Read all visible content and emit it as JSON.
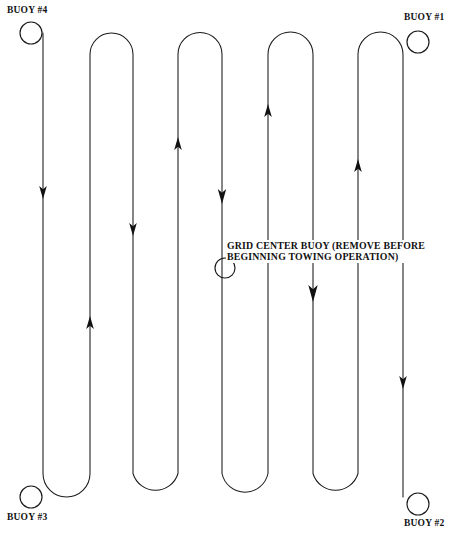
{
  "diagram": {
    "type": "survey-track-plan",
    "stroke_color": "#1a1a1a",
    "background_color": "#ffffff"
  },
  "buoys": [
    {
      "id": "buoy-1",
      "label": "BUOY #1",
      "cx": 418,
      "cy": 42,
      "r": 11
    },
    {
      "id": "buoy-2",
      "label": "BUOY #2",
      "cx": 418,
      "cy": 504,
      "r": 11
    },
    {
      "id": "buoy-3",
      "label": "BUOY #3",
      "cx": 31,
      "cy": 497,
      "r": 11
    },
    {
      "id": "buoy-4",
      "label": "BUOY #4",
      "cx": 31,
      "cy": 33,
      "r": 11
    },
    {
      "id": "grid-center-buoy",
      "label": "",
      "cx": 225,
      "cy": 268,
      "r": 10
    }
  ],
  "center_note": {
    "line1": "GRID CENTER BUOY (REMOVE BEFORE",
    "line2": "BEGINNING TOWING OPERATION)"
  },
  "track": {
    "lane_x": [
      43,
      90,
      133,
      178,
      222,
      268,
      313,
      358,
      403
    ],
    "top_y": 33,
    "bottom_y": 497,
    "turn_radius_top": 21.5,
    "turn_radius_bottom": 23.5,
    "direction_sequence": [
      "down",
      "up",
      "down",
      "up",
      "down",
      "up",
      "down",
      "up",
      "down"
    ]
  },
  "arrows": [
    {
      "lane": 0,
      "x": 43,
      "y": 193,
      "dir": "down"
    },
    {
      "lane": 1,
      "x": 90,
      "y": 322,
      "dir": "up"
    },
    {
      "lane": 2,
      "x": 133,
      "y": 230,
      "dir": "down"
    },
    {
      "lane": 3,
      "x": 178,
      "y": 143,
      "dir": "up"
    },
    {
      "lane": 4,
      "x": 222,
      "y": 197,
      "dir": "down"
    },
    {
      "lane": 5,
      "x": 268,
      "y": 110,
      "dir": "up"
    },
    {
      "lane": 6,
      "x": 313,
      "y": 293,
      "dir": "down"
    },
    {
      "lane": 7,
      "x": 358,
      "y": 165,
      "dir": "up"
    },
    {
      "lane": 8,
      "x": 403,
      "y": 382,
      "dir": "down"
    }
  ]
}
